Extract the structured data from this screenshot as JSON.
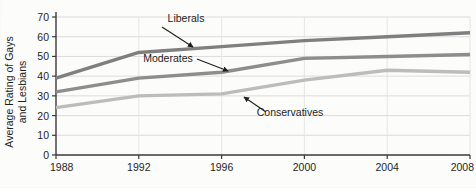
{
  "chart_data": {
    "type": "line",
    "title": "",
    "subtitle": "",
    "xlabel": "",
    "ylabel": "Average Rating of Gays and Lesbians",
    "ylabel_line1": "Average Rating of Gays",
    "ylabel_line2": "and Lesbians",
    "x": [
      1988,
      1992,
      1996,
      2000,
      2004,
      2008
    ],
    "categories": [
      "1988",
      "1992",
      "1996",
      "2000",
      "2004",
      "2008"
    ],
    "xlim": [
      1988,
      2008
    ],
    "ylim": [
      0,
      70
    ],
    "yticks": [
      0,
      10,
      20,
      30,
      40,
      50,
      60,
      70
    ],
    "ytick_labels": [
      "0",
      "10",
      "20",
      "30",
      "40",
      "50",
      "60",
      "70"
    ],
    "xticks": [
      1988,
      1992,
      1996,
      2000,
      2004,
      2008
    ],
    "xtick_labels": [
      "1988",
      "1992",
      "1996",
      "2000",
      "2004",
      "2008"
    ],
    "grid": true,
    "grid_horizontal": true,
    "grid_vertical": true,
    "legend": "inline-annotations",
    "legend_position": "none",
    "series": [
      {
        "name": "Liberals",
        "label": "Liberals",
        "color": "#7f7f7f",
        "values": [
          39,
          52,
          55,
          58,
          60,
          62
        ]
      },
      {
        "name": "Moderates",
        "label": "Moderates",
        "color": "#8d8d8d",
        "values": [
          32,
          39,
          42,
          49,
          50,
          51
        ]
      },
      {
        "name": "Conservatives",
        "label": "Conservatives",
        "color": "#bcbcbc",
        "values": [
          24,
          30,
          31,
          38,
          43,
          42
        ]
      }
    ],
    "annotations": [
      {
        "text": "Liberals",
        "target_series": "Liberals",
        "target_x": 1995
      },
      {
        "text": "Moderates",
        "target_series": "Moderates",
        "target_x": 1996
      },
      {
        "text": "Conservatives",
        "target_series": "Conservatives",
        "target_x": 1996
      }
    ]
  },
  "axis": {
    "y_title_line1": "Average Rating of Gays",
    "y_title_line2": "and Lesbians",
    "y_labels": [
      "70",
      "60",
      "50",
      "40",
      "30",
      "20",
      "10",
      "0"
    ],
    "x_labels": [
      "1988",
      "1992",
      "1996",
      "2000",
      "2004",
      "2008"
    ]
  },
  "labels": {
    "liberals": "Liberals",
    "moderates": "Moderates",
    "conservatives": "Conservatives"
  },
  "colors": {
    "liberals": "#7f7f7f",
    "moderates": "#8d8d8d",
    "conservatives": "#bcbcbc",
    "axis": "#3a3a3a",
    "grid": "#d8d8d8",
    "background": "#fcfcfa"
  }
}
